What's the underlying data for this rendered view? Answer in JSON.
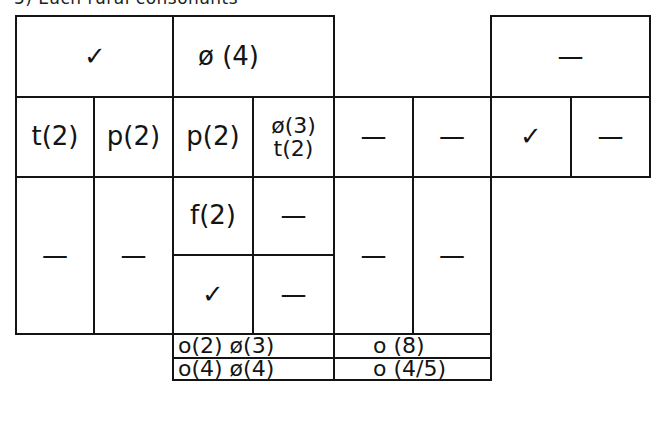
{
  "header": {
    "text": "5) Each rural consonants"
  },
  "grid": {
    "row1": {
      "c1_2": "✓",
      "c3_4": "ø (4)",
      "c7_8": "—"
    },
    "row2": {
      "c1": "t(2)",
      "c2": "p(2)",
      "c3": "p(2)",
      "c4_line1": "ø(3)",
      "c4_line2": "t(2)",
      "c5": "—",
      "c6": "—",
      "c7": "✓",
      "c8": "—"
    },
    "row3": {
      "c1": "—",
      "c2": "—",
      "c3_top": "f(2)",
      "c4_top": "—",
      "c3_bottom": "✓",
      "c4_bottom": "—",
      "c5": "—",
      "c6": "—"
    },
    "summary": {
      "row1_left": "o(2) ø(3)",
      "row1_right": "o (8)",
      "row2_left": "o(4) ø(4)",
      "row2_right": "o (4/5)"
    }
  },
  "colors": {
    "ink": "#141414",
    "paper": "#ffffff"
  }
}
